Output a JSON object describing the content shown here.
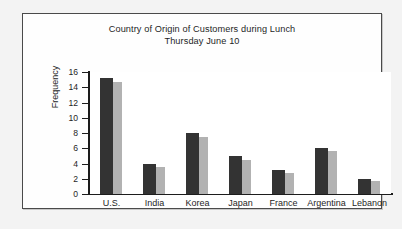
{
  "chart_data": {
    "type": "bar",
    "title": "Country of Origin of Customers during Lunch",
    "subtitle": "Thursday June 10",
    "xlabel": "",
    "ylabel": "Frequency",
    "ylim": [
      0,
      16
    ],
    "ytick_step": 2,
    "yticks": [
      0,
      2,
      4,
      6,
      8,
      10,
      12,
      14,
      16
    ],
    "grid": false,
    "legend": "none",
    "categories": [
      "U.S.",
      "India",
      "Korea",
      "Japan",
      "France",
      "Argentina",
      "Lebanon"
    ],
    "series": [
      {
        "name": "dark-series",
        "color": "#333333",
        "values": [
          15.2,
          4.0,
          8.0,
          5.0,
          3.2,
          6.0,
          2.0
        ]
      },
      {
        "name": "light-series",
        "color": "#b2b2b2",
        "values": [
          14.7,
          3.5,
          7.5,
          4.5,
          2.8,
          5.6,
          1.7
        ]
      }
    ]
  },
  "colors": {
    "page_background": "#f3f3f3",
    "frame_background": "#fefefe",
    "frame_border": "#4a4a4a",
    "plot_background": "#ffffff",
    "axis": "#1c1c1c",
    "text": "#1e1e1e",
    "series_dark": "#333333",
    "series_light": "#b2b2b2"
  }
}
